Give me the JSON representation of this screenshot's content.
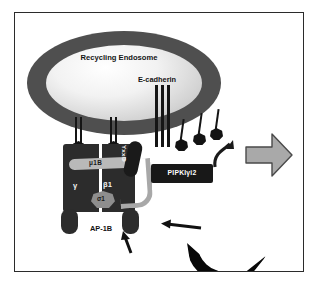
{
  "figure": {
    "type": "cell-biology-diagram"
  },
  "compartments": {
    "endosome_label": "Recycling Endosome",
    "plasma_membrane_label": "Plasma Membrane"
  },
  "cargo": {
    "ecadherin_label": "E-cadherin"
  },
  "complex": {
    "name_label": "AP-1B",
    "subunits": {
      "mu": "μ1B",
      "gamma": "γ",
      "beta": "β1",
      "sigma": "σ1"
    },
    "motif_label": "YxxΦ"
  },
  "kinase": {
    "label": "PIPKIγi2"
  },
  "coat": {
    "clathrin_right_label": "Clathrin",
    "clathrin_bottom_label": "Clathrin"
  },
  "arrows": {
    "transport_arrow": "arrow-right-to-plasma-membrane",
    "recruit_arrow": "arrow-left-clathrin-to-complex",
    "assembly_arrow": "arrow-up-clathrin-to-complex",
    "cargo_arrow": "curved-arrow-cargo-exit"
  },
  "colors": {
    "endosome_membrane": "#4f4f4f",
    "complex_body": "#2c2c2c",
    "mu_band": "#b9b9b9",
    "clathrin": "#080808",
    "plasma_membrane": "#1d1d1d",
    "transport_arrow": "#a9a9a9",
    "frame": "#2b2b2b"
  }
}
